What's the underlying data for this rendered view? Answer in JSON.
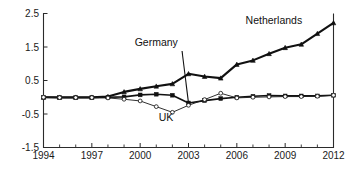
{
  "chart_data": {
    "type": "line",
    "title": "",
    "subtitle": "",
    "xlabel": "",
    "ylabel": "",
    "xlim": [
      1994,
      2012
    ],
    "ylim": [
      -1.5,
      2.5
    ],
    "grid": false,
    "legend_position": "inline-annotations",
    "x": [
      1994,
      1995,
      1996,
      1997,
      1998,
      1999,
      2000,
      2001,
      2002,
      2003,
      2004,
      2005,
      2006,
      2007,
      2008,
      2009,
      2010,
      2011,
      2012
    ],
    "xticks": [
      1994,
      1997,
      2000,
      2003,
      2006,
      2009,
      2012
    ],
    "xtick_labels": [
      "1994",
      "1997",
      "2000",
      "2003",
      "2006",
      "2009",
      "2012"
    ],
    "xminor_ticks": [
      1995,
      1996,
      1998,
      1999,
      2001,
      2002,
      2004,
      2005,
      2007,
      2008,
      2010,
      2011
    ],
    "yticks": [
      -1.5,
      -0.5,
      0.5,
      1.5,
      2.5
    ],
    "ytick_labels": [
      "-1.5",
      "-0.5",
      "0.5",
      "1.5",
      "2.5"
    ],
    "series": [
      {
        "name": "Netherlands",
        "marker": "triangle",
        "line_width": 2.1,
        "color": "#111111",
        "label_x": 2008.3,
        "label_y": 2.18,
        "values": [
          0.0,
          0.0,
          0.0,
          0.0,
          0.02,
          0.16,
          0.25,
          0.33,
          0.4,
          0.7,
          0.62,
          0.57,
          0.98,
          1.1,
          1.3,
          1.48,
          1.58,
          1.9,
          2.22
        ]
      },
      {
        "name": "Germany",
        "marker": "square",
        "line_width": 1.6,
        "color": "#111111",
        "label_x": 2001.0,
        "label_y": 1.52,
        "leader_from_x": 2002.6,
        "leader_from_y": 1.38,
        "leader_to_x": 2003.0,
        "leader_to_y": -0.17,
        "values": [
          0.0,
          -0.01,
          -0.01,
          -0.01,
          0.0,
          0.01,
          0.07,
          0.09,
          0.06,
          -0.17,
          -0.1,
          -0.04,
          0.0,
          0.03,
          0.05,
          0.04,
          0.04,
          0.04,
          0.06
        ]
      },
      {
        "name": "UK",
        "marker": "circle-open",
        "line_width": 0.9,
        "color": "#1a1a1a",
        "label_x": 2001.6,
        "label_y": -0.72,
        "values": [
          0.0,
          -0.01,
          -0.01,
          -0.01,
          -0.02,
          -0.06,
          -0.11,
          -0.28,
          -0.45,
          -0.24,
          -0.07,
          0.12,
          -0.02,
          0.0,
          0.01,
          0.02,
          0.02,
          0.03,
          0.06
        ]
      }
    ],
    "annotations": [
      {
        "text": "Netherlands",
        "x": 2008.3,
        "y": 2.18
      },
      {
        "text": "Germany",
        "x": 2001.0,
        "y": 1.52
      },
      {
        "text": "UK",
        "x": 2001.6,
        "y": -0.72
      }
    ]
  }
}
